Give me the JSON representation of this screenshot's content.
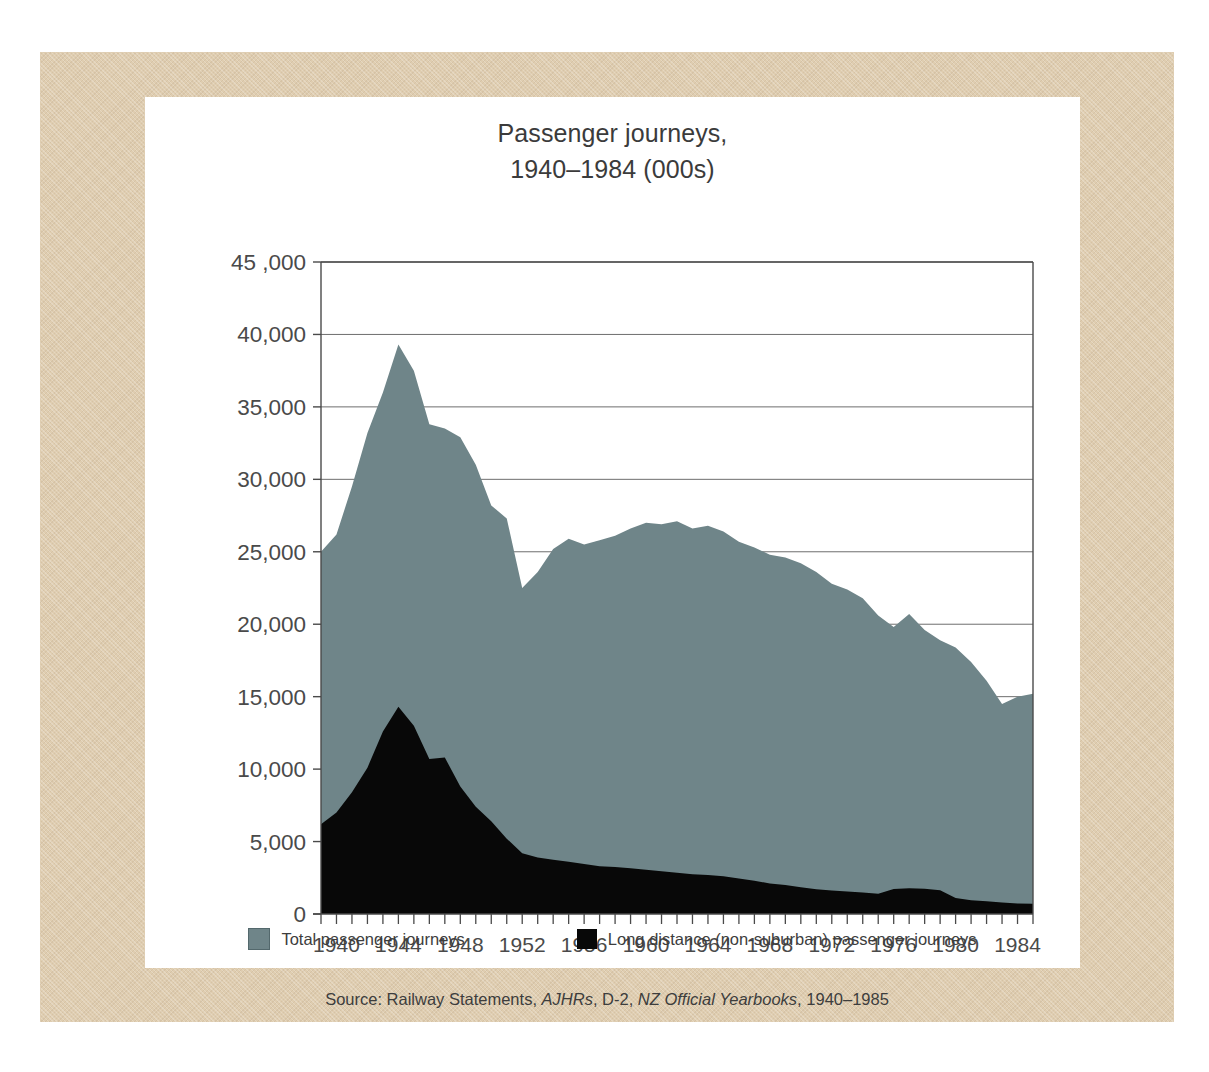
{
  "chart_data": {
    "type": "area",
    "title": "Passenger journeys,",
    "title_line2": "1940–1984 (000s)",
    "xlabel": "",
    "ylabel": "",
    "ylim": [
      0,
      45000
    ],
    "xlim": [
      1939,
      1985
    ],
    "grid": true,
    "legend_position": "bottom",
    "ytick_labels": [
      "45 ,000",
      "40,000",
      "35,000",
      "30,000",
      "25,000",
      "20,000",
      "15,000",
      "10,000",
      "5,000",
      "0"
    ],
    "ytick_values": [
      45000,
      40000,
      35000,
      30000,
      25000,
      20000,
      15000,
      10000,
      5000,
      0
    ],
    "xtick_labels": [
      "1940",
      "1944",
      "1948",
      "1952",
      "1956",
      "1960",
      "1964",
      "1968",
      "1972",
      "1976",
      "1980",
      "1984"
    ],
    "xtick_values": [
      1940,
      1944,
      1948,
      1952,
      1956,
      1960,
      1964,
      1968,
      1972,
      1976,
      1980,
      1984
    ],
    "x": [
      1939,
      1940,
      1941,
      1942,
      1943,
      1944,
      1945,
      1946,
      1947,
      1948,
      1949,
      1950,
      1951,
      1952,
      1953,
      1954,
      1955,
      1956,
      1957,
      1958,
      1959,
      1960,
      1961,
      1962,
      1963,
      1964,
      1965,
      1966,
      1967,
      1968,
      1969,
      1970,
      1971,
      1972,
      1973,
      1974,
      1975,
      1976,
      1977,
      1978,
      1979,
      1980,
      1981,
      1982,
      1983,
      1984,
      1985
    ],
    "series": [
      {
        "name": "Total passenger journeys",
        "color": "#6f8589",
        "values": [
          25000,
          26200,
          29500,
          33200,
          36000,
          39300,
          37500,
          33800,
          33500,
          32900,
          31000,
          28200,
          27300,
          22500,
          23600,
          25200,
          25900,
          25500,
          25800,
          26100,
          26600,
          27000,
          26900,
          27100,
          26600,
          26800,
          26400,
          25700,
          25300,
          24800,
          24600,
          24200,
          23600,
          22800,
          22400,
          21800,
          20600,
          19800,
          20700,
          19600,
          18900,
          18400,
          17400,
          16100,
          14500,
          15000,
          15200
        ]
      },
      {
        "name": "Long distance (non-suburban) passenger journeys",
        "color": "#080808",
        "values": [
          6200,
          7000,
          8400,
          10100,
          12600,
          14300,
          13000,
          10700,
          10800,
          8800,
          7400,
          6400,
          5200,
          4200,
          3900,
          3750,
          3600,
          3450,
          3300,
          3250,
          3150,
          3050,
          2950,
          2850,
          2750,
          2700,
          2600,
          2450,
          2300,
          2100,
          2000,
          1850,
          1700,
          1620,
          1560,
          1480,
          1400,
          1720,
          1780,
          1740,
          1640,
          1100,
          950,
          880,
          800,
          720,
          700
        ]
      }
    ]
  },
  "legend": {
    "items": [
      {
        "label": "Total passenger journeys",
        "color": "#6f8589"
      },
      {
        "label": "Long distance (non-suburban) passenger journeys",
        "color": "#080808"
      }
    ]
  },
  "source": {
    "prefix": "Source: Railway Statements, ",
    "italic1": "AJHRs",
    "mid": ", D-2, ",
    "italic2": "NZ Official Yearbooks",
    "suffix": ", 1940–1985"
  },
  "colors": {
    "mat": "#dfcdb0",
    "panel": "#ffffff",
    "total_area": "#6f8589",
    "long_area": "#080808",
    "axis": "#4a4a4a",
    "grid": "#6e6e6e",
    "text": "#3d3d3d"
  }
}
